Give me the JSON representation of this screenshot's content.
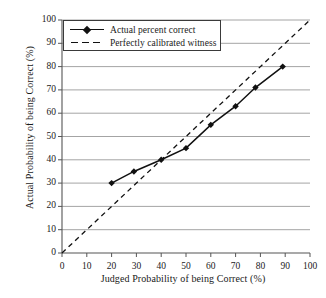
{
  "chart_data": {
    "type": "line",
    "title": "",
    "xlabel": "Judged Probability of being Correct (%)",
    "ylabel": "Actual Probability of being Correct (%)",
    "xlim": [
      0,
      100
    ],
    "ylim": [
      0,
      100
    ],
    "xticks": [
      0,
      10,
      20,
      30,
      40,
      50,
      60,
      70,
      80,
      90,
      100
    ],
    "yticks": [
      0,
      10,
      20,
      30,
      40,
      50,
      60,
      70,
      80,
      90,
      100
    ],
    "grid": "horizontal",
    "legend_position": "top-left",
    "series": [
      {
        "name": "Actual percent correct",
        "style": "solid-with-diamond-markers",
        "color": "#111111",
        "points": [
          {
            "x": 20,
            "y": 30
          },
          {
            "x": 29,
            "y": 35
          },
          {
            "x": 40,
            "y": 40
          },
          {
            "x": 50,
            "y": 45
          },
          {
            "x": 60,
            "y": 55
          },
          {
            "x": 70,
            "y": 63
          },
          {
            "x": 78,
            "y": 71
          },
          {
            "x": 89,
            "y": 80
          }
        ]
      },
      {
        "name": "Perfectly calibrated witness",
        "style": "dashed",
        "color": "#111111",
        "points": [
          {
            "x": 0,
            "y": 0
          },
          {
            "x": 100,
            "y": 100
          }
        ]
      }
    ]
  },
  "axes": {
    "x_label": "Judged Probability of being Correct (%)",
    "y_label": "Actual Probability of being Correct (%)",
    "x_tick_labels": [
      "0",
      "10",
      "20",
      "30",
      "40",
      "50",
      "60",
      "70",
      "80",
      "90",
      "100"
    ],
    "y_tick_labels": [
      "0",
      "10",
      "20",
      "30",
      "40",
      "50",
      "60",
      "70",
      "80",
      "90",
      "100"
    ]
  },
  "legend": {
    "entries": [
      {
        "label": "Actual percent correct"
      },
      {
        "label": "Perfectly calibrated witness"
      }
    ]
  },
  "colors": {
    "ink": "#111111",
    "grid": "#9a9a9a",
    "axis": "#555555",
    "background": "#ffffff"
  }
}
